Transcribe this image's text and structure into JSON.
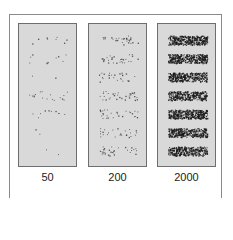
{
  "figure": {
    "panels": [
      {
        "label": "50",
        "density": 50,
        "bands": 7
      },
      {
        "label": "200",
        "density": 200,
        "bands": 7
      },
      {
        "label": "2000",
        "density": 2000,
        "bands": 7
      }
    ],
    "caption": "",
    "colors": {
      "panel_bg": "#d9d9d9",
      "dot": "#1a1a1a",
      "frame": "#8a8a8a"
    }
  }
}
